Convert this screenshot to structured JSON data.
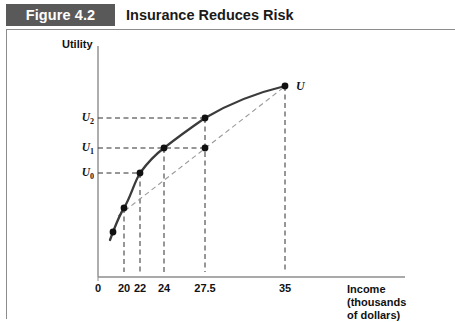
{
  "header": {
    "figure_number": "Figure 4.2",
    "title": "Insurance Reduces Risk"
  },
  "axes": {
    "y_title": "Utility",
    "x_title": "Income\n(thousands\nof dollars)",
    "curve_label": "U"
  },
  "chart_data": {
    "type": "line",
    "title": "Insurance Reduces Risk",
    "xlabel": "Income (thousands of dollars)",
    "ylabel": "Utility",
    "grid": false,
    "legend": null,
    "xlim": [
      0,
      42
    ],
    "ylim": [
      0,
      1
    ],
    "x_ticks": [
      {
        "label": "0",
        "value": 0,
        "px": 98
      },
      {
        "label": "20",
        "value": 20,
        "px": 124
      },
      {
        "label": "22",
        "value": 22,
        "px": 140
      },
      {
        "label": "24",
        "value": 24,
        "px": 164
      },
      {
        "label": "27.5",
        "value": 27.5,
        "px": 205
      },
      {
        "label": "35",
        "value": 35,
        "px": 285
      }
    ],
    "y_ticks": [
      {
        "label": "U2",
        "value": 0.86,
        "px": 118
      },
      {
        "label": "U1",
        "value": 0.73,
        "px": 148
      },
      {
        "label": "U0",
        "value": 0.62,
        "px": 173
      }
    ],
    "series": [
      {
        "name": "U",
        "style": "solid",
        "description": "Concave utility-of-income curve",
        "points": [
          {
            "x": 18.0,
            "y_px": 232,
            "x_px": 113
          },
          {
            "x": 20.0,
            "y_px": 208,
            "x_px": 124
          },
          {
            "x": 22.0,
            "y_px": 173,
            "x_px": 140
          },
          {
            "x": 24.0,
            "y_px": 148,
            "x_px": 164
          },
          {
            "x": 27.5,
            "y_px": 118,
            "x_px": 205
          },
          {
            "x": 35.0,
            "y_px": 86,
            "x_px": 285
          }
        ]
      },
      {
        "name": "chord",
        "style": "dashed",
        "description": "Straight chord from the 20 point to the 35 point",
        "points": [
          {
            "x": 20.0,
            "y_px": 208,
            "x_px": 124
          },
          {
            "x": 35.0,
            "y_px": 86,
            "x_px": 285
          }
        ]
      }
    ],
    "markers": [
      {
        "name": "point-20-on-curve",
        "x": 20,
        "x_px": 124,
        "y_px": 208
      },
      {
        "name": "point-22-on-curve",
        "x": 22,
        "x_px": 140,
        "y_px": 173
      },
      {
        "name": "point-24-on-curve",
        "x": 24,
        "x_px": 164,
        "y_px": 148
      },
      {
        "name": "point-27-5-on-curve",
        "x": 27.5,
        "x_px": 205,
        "y_px": 118
      },
      {
        "name": "point-27-5-on-chord",
        "x": 27.5,
        "x_px": 205,
        "y_px": 148
      },
      {
        "name": "point-35-on-curve",
        "x": 35,
        "x_px": 285,
        "y_px": 86
      },
      {
        "name": "point-18-on-curve",
        "x": 18,
        "x_px": 113,
        "y_px": 232
      }
    ],
    "guide_lines": [
      {
        "name": "u2-horizontal",
        "from_px": [
          98,
          118
        ],
        "to_px": [
          205,
          118
        ]
      },
      {
        "name": "u1-horizontal",
        "from_px": [
          98,
          148
        ],
        "to_px": [
          205,
          148
        ]
      },
      {
        "name": "u0-horizontal",
        "from_px": [
          98,
          173
        ],
        "to_px": [
          140,
          173
        ]
      },
      {
        "name": "x20-vertical",
        "from_px": [
          124,
          208
        ],
        "to_px": [
          124,
          272
        ]
      },
      {
        "name": "x22-vertical",
        "from_px": [
          140,
          173
        ],
        "to_px": [
          140,
          272
        ]
      },
      {
        "name": "x24-vertical",
        "from_px": [
          164,
          148
        ],
        "to_px": [
          164,
          272
        ]
      },
      {
        "name": "x27-5-vertical",
        "from_px": [
          205,
          118
        ],
        "to_px": [
          205,
          272
        ]
      },
      {
        "name": "x35-vertical",
        "from_px": [
          285,
          86
        ],
        "to_px": [
          285,
          272
        ]
      }
    ],
    "colors": {
      "curve": "#3b3b3b",
      "chord": "#9a9a9a",
      "axis": "#8c8c8c",
      "marker": "#111111",
      "title_box": "#595959",
      "text": "#111111"
    }
  }
}
